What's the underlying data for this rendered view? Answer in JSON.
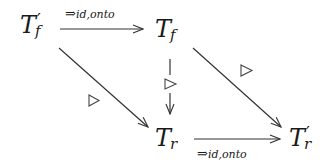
{
  "diagram": {
    "type": "commutative-diagram",
    "nodes": [
      {
        "id": "Tf_prime",
        "base": "T",
        "sub": "f",
        "prime": "′"
      },
      {
        "id": "Tf",
        "base": "T",
        "sub": "f",
        "prime": ""
      },
      {
        "id": "Tr",
        "base": "T",
        "sub": "r",
        "prime": ""
      },
      {
        "id": "Tr_prime",
        "base": "T",
        "sub": "r",
        "prime": "′"
      }
    ],
    "edges": [
      {
        "from": "Tf_prime",
        "to": "Tf",
        "label_arrow": "⇒",
        "label_sub": "id,onto",
        "label_position": "above"
      },
      {
        "from": "Tr",
        "to": "Tr_prime",
        "label_arrow": "⇒",
        "label_sub": "id,onto",
        "label_position": "below"
      },
      {
        "from": "Tf_prime",
        "to": "Tr",
        "marker": "▷"
      },
      {
        "from": "Tf",
        "to": "Tr_prime",
        "marker": "▷"
      },
      {
        "from": "Tf",
        "to": "Tr",
        "marker": "▷",
        "style": "broken"
      }
    ],
    "marker_glyph": "▷",
    "stroke_color": "#333333"
  }
}
